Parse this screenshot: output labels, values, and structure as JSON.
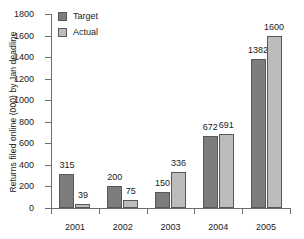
{
  "chart_data": {
    "type": "bar",
    "title": "",
    "subtitle": "",
    "xlabel": "",
    "ylabel": "Returns filed online (000) by Jan deadline",
    "categories": [
      "2001",
      "2002",
      "2003",
      "2004",
      "2005"
    ],
    "series": [
      {
        "name": "Target",
        "color": "#7d7d7d",
        "values": [
          315,
          200,
          150,
          672,
          1382
        ]
      },
      {
        "name": "Actual",
        "color": "#bcbcbc",
        "values": [
          39,
          75,
          336,
          691,
          1600
        ]
      }
    ],
    "ylim": [
      0,
      1800
    ],
    "ytick_step": 200,
    "ytick_labels": [
      "0",
      "200",
      "400",
      "600",
      "800",
      "1000",
      "1200",
      "1400",
      "1600",
      "1800"
    ],
    "grid": false,
    "legend_position": "top-left",
    "data_labels_shown": true,
    "axis_color": "#6e6e6e",
    "background": "#ffffff"
  },
  "legend": {
    "items": [
      {
        "label": "Target",
        "color": "#7d7d7d"
      },
      {
        "label": "Actual",
        "color": "#bcbcbc"
      }
    ]
  }
}
